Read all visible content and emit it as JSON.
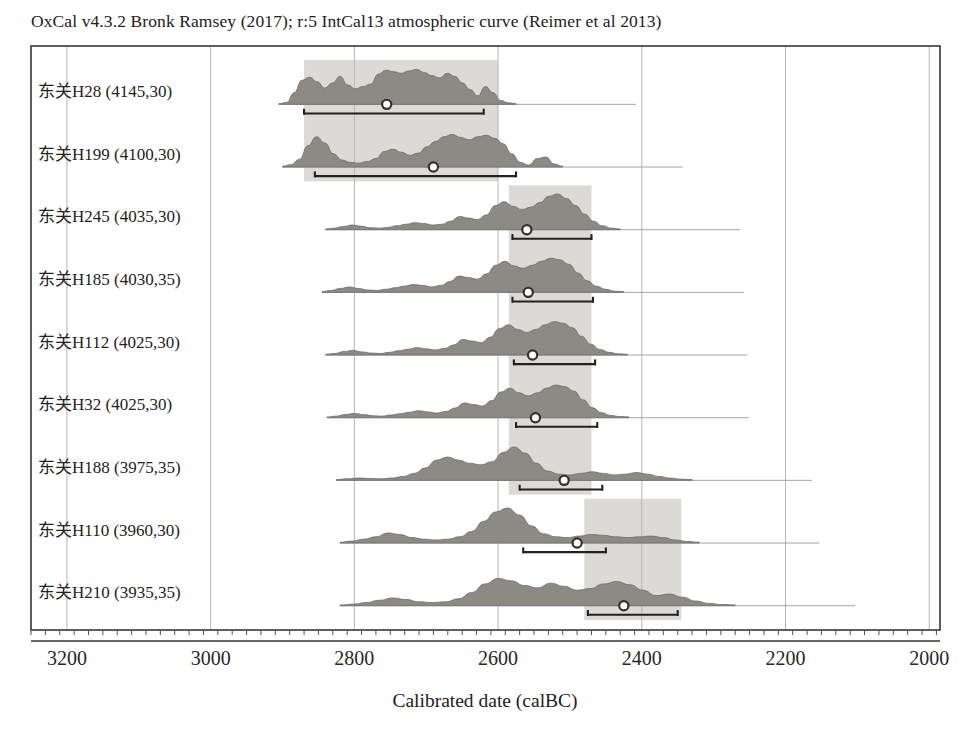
{
  "header": {
    "title": "OxCal v4.3.2 Bronk Ramsey (2017); r:5 IntCal13 atmospheric curve (Reimer et al 2013)"
  },
  "axis": {
    "title": "Calibrated date (calBC)",
    "tick_labels": [
      "3200",
      "3000",
      "2800",
      "2600",
      "2400",
      "2200",
      "2000"
    ]
  },
  "chart_data": {
    "type": "area",
    "title": "OxCal v4.3.2 Bronk Ramsey (2017); r:5 IntCal13 atmospheric curve (Reimer et al 2013)",
    "xlabel": "Calibrated date (calBC)",
    "ylabel": "",
    "xlim": [
      3250,
      1985
    ],
    "x_reversed": true,
    "xticks": [
      3200,
      3000,
      2800,
      2600,
      2400,
      2200,
      2000
    ],
    "minor_tick_step": 20,
    "grid": "vertical-only",
    "legend": "none",
    "highlight_bands": [
      {
        "label": "band-upper",
        "from": 2870,
        "to": 2600,
        "rows": [
          0,
          1
        ]
      },
      {
        "label": "band-middle",
        "from": 2585,
        "to": 2470,
        "rows": [
          2,
          3,
          4,
          5,
          6
        ]
      },
      {
        "label": "band-lower",
        "from": 2480,
        "to": 2345,
        "rows": [
          7,
          8
        ]
      }
    ],
    "series": [
      {
        "name": "东关H28 (4145,30)",
        "site": "东关",
        "context": "H28",
        "c14_age": 4145,
        "error": 30,
        "median": 2755,
        "range_from": 2870,
        "range_to": 2620,
        "curve_from": 2905,
        "curve_to": 2575,
        "profile": [
          0.02,
          0.05,
          0.3,
          0.62,
          0.7,
          0.58,
          0.42,
          0.55,
          0.72,
          0.5,
          0.4,
          0.46,
          0.52,
          0.78,
          0.88,
          0.84,
          0.8,
          0.86,
          0.9,
          0.82,
          0.74,
          0.68,
          0.8,
          0.72,
          0.55,
          0.38,
          0.22,
          0.46,
          0.3,
          0.1,
          0.04,
          0.02
        ]
      },
      {
        "name": "东关H199 (4100,30)",
        "site": "东关",
        "context": "H199",
        "c14_age": 4100,
        "error": 30,
        "median": 2690,
        "range_from": 2855,
        "range_to": 2575,
        "curve_from": 2900,
        "curve_to": 2510,
        "profile": [
          0.02,
          0.06,
          0.2,
          0.55,
          0.78,
          0.62,
          0.34,
          0.18,
          0.12,
          0.1,
          0.14,
          0.22,
          0.4,
          0.46,
          0.38,
          0.3,
          0.36,
          0.52,
          0.66,
          0.78,
          0.84,
          0.76,
          0.7,
          0.78,
          0.82,
          0.74,
          0.6,
          0.34,
          0.12,
          0.05,
          0.22,
          0.26,
          0.08,
          0.02
        ]
      },
      {
        "name": "东关H245 (4035,30)",
        "site": "东关",
        "context": "H245",
        "c14_age": 4035,
        "error": 30,
        "median": 2560,
        "range_from": 2580,
        "range_to": 2470,
        "curve_from": 2840,
        "curve_to": 2430,
        "profile": [
          0.02,
          0.04,
          0.08,
          0.12,
          0.09,
          0.05,
          0.04,
          0.06,
          0.1,
          0.14,
          0.18,
          0.16,
          0.12,
          0.14,
          0.22,
          0.34,
          0.3,
          0.26,
          0.38,
          0.62,
          0.72,
          0.6,
          0.52,
          0.58,
          0.7,
          0.86,
          0.92,
          0.8,
          0.62,
          0.4,
          0.22,
          0.1,
          0.04,
          0.02
        ]
      },
      {
        "name": "东关H185 (4030,35)",
        "site": "东关",
        "context": "H185",
        "c14_age": 4030,
        "error": 35,
        "median": 2558,
        "range_from": 2580,
        "range_to": 2468,
        "curve_from": 2845,
        "curve_to": 2425,
        "profile": [
          0.02,
          0.05,
          0.1,
          0.14,
          0.1,
          0.06,
          0.05,
          0.08,
          0.12,
          0.16,
          0.2,
          0.18,
          0.14,
          0.18,
          0.28,
          0.42,
          0.38,
          0.34,
          0.48,
          0.7,
          0.8,
          0.68,
          0.62,
          0.7,
          0.8,
          0.88,
          0.84,
          0.72,
          0.5,
          0.3,
          0.16,
          0.08,
          0.03,
          0.02
        ]
      },
      {
        "name": "东关H112 (4025,30)",
        "site": "东关",
        "context": "H112",
        "c14_age": 4025,
        "error": 30,
        "median": 2552,
        "range_from": 2578,
        "range_to": 2465,
        "curve_from": 2840,
        "curve_to": 2420,
        "profile": [
          0.02,
          0.04,
          0.09,
          0.12,
          0.08,
          0.05,
          0.04,
          0.07,
          0.11,
          0.15,
          0.19,
          0.16,
          0.13,
          0.17,
          0.26,
          0.4,
          0.36,
          0.32,
          0.46,
          0.68,
          0.78,
          0.66,
          0.58,
          0.66,
          0.78,
          0.86,
          0.82,
          0.7,
          0.48,
          0.28,
          0.14,
          0.07,
          0.03,
          0.02
        ]
      },
      {
        "name": "东关H32 (4025,30)",
        "site": "东关",
        "context": "H32",
        "c14_age": 4025,
        "error": 30,
        "median": 2548,
        "range_from": 2575,
        "range_to": 2462,
        "curve_from": 2838,
        "curve_to": 2418,
        "profile": [
          0.02,
          0.04,
          0.08,
          0.11,
          0.08,
          0.05,
          0.04,
          0.07,
          0.1,
          0.14,
          0.18,
          0.15,
          0.12,
          0.16,
          0.25,
          0.38,
          0.34,
          0.3,
          0.44,
          0.66,
          0.76,
          0.64,
          0.56,
          0.64,
          0.76,
          0.84,
          0.8,
          0.68,
          0.46,
          0.26,
          0.13,
          0.06,
          0.03,
          0.02
        ]
      },
      {
        "name": "东关H188 (3975,35)",
        "site": "东关",
        "context": "H188",
        "c14_age": 3975,
        "error": 35,
        "median": 2508,
        "range_from": 2570,
        "range_to": 2455,
        "curve_from": 2825,
        "curve_to": 2330,
        "profile": [
          0.02,
          0.04,
          0.06,
          0.05,
          0.04,
          0.06,
          0.1,
          0.18,
          0.32,
          0.52,
          0.6,
          0.52,
          0.44,
          0.4,
          0.48,
          0.72,
          0.86,
          0.7,
          0.44,
          0.24,
          0.16,
          0.14,
          0.18,
          0.22,
          0.18,
          0.14,
          0.16,
          0.2,
          0.16,
          0.1,
          0.06,
          0.03,
          0.02
        ]
      },
      {
        "name": "东关H110 (3960,30)",
        "site": "东关",
        "context": "H110",
        "c14_age": 3960,
        "error": 30,
        "median": 2490,
        "range_from": 2565,
        "range_to": 2450,
        "curve_from": 2820,
        "curve_to": 2320,
        "profile": [
          0.02,
          0.05,
          0.1,
          0.16,
          0.26,
          0.22,
          0.14,
          0.1,
          0.08,
          0.1,
          0.16,
          0.3,
          0.56,
          0.8,
          0.9,
          0.72,
          0.44,
          0.24,
          0.16,
          0.14,
          0.18,
          0.22,
          0.2,
          0.16,
          0.14,
          0.16,
          0.18,
          0.14,
          0.08,
          0.04,
          0.02
        ]
      },
      {
        "name": "东关H210 (3935,35)",
        "site": "东关",
        "context": "H210",
        "c14_age": 3935,
        "error": 35,
        "median": 2425,
        "range_from": 2475,
        "range_to": 2350,
        "curve_from": 2820,
        "curve_to": 2270,
        "profile": [
          0.02,
          0.04,
          0.08,
          0.14,
          0.2,
          0.16,
          0.1,
          0.08,
          0.1,
          0.18,
          0.34,
          0.56,
          0.7,
          0.64,
          0.52,
          0.46,
          0.58,
          0.5,
          0.4,
          0.44,
          0.56,
          0.62,
          0.54,
          0.4,
          0.26,
          0.3,
          0.22,
          0.12,
          0.06,
          0.03,
          0.02
        ]
      }
    ]
  }
}
